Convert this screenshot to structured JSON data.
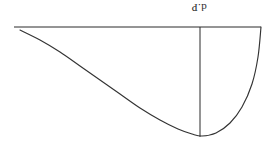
{
  "figure": {
    "background_color": "#ffffff",
    "ink_color": "#2e2e2e",
    "orientation_note": "inverted",
    "labels": [
      {
        "id": "dp",
        "text": "d.P",
        "x": 199,
        "y": 10,
        "rotation_deg": 180
      }
    ]
  },
  "chart_data": {
    "type": "line",
    "title": "",
    "subtitle": "",
    "xlabel": "",
    "ylabel": "",
    "xlim": [
      0,
      275
    ],
    "ylim": [
      0,
      152
    ],
    "grid": false,
    "legend": null,
    "annotations": [
      {
        "text": "d.P",
        "x": 199,
        "y": 10,
        "rotation_deg": 180
      }
    ],
    "series": [
      {
        "name": "baseline",
        "kind": "straight-segment",
        "points": [
          [
            14,
            27
          ],
          [
            261,
            27
          ]
        ]
      },
      {
        "name": "ordinate",
        "kind": "straight-segment",
        "points": [
          [
            200,
            27
          ],
          [
            200,
            137
          ]
        ]
      },
      {
        "name": "curve",
        "kind": "smooth-curve",
        "points": [
          [
            20,
            30
          ],
          [
            40,
            40
          ],
          [
            60,
            52
          ],
          [
            80,
            66
          ],
          [
            100,
            80
          ],
          [
            120,
            94
          ],
          [
            140,
            108
          ],
          [
            160,
            120
          ],
          [
            178,
            129
          ],
          [
            192,
            134
          ],
          [
            202,
            136
          ],
          [
            216,
            133
          ],
          [
            230,
            123
          ],
          [
            242,
            107
          ],
          [
            252,
            84
          ],
          [
            258,
            57
          ],
          [
            261,
            27
          ]
        ]
      }
    ]
  }
}
